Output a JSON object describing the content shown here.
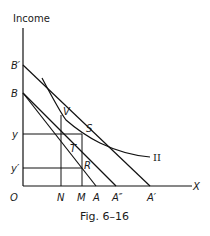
{
  "figure": {
    "y_axis_label": "Income",
    "x_axis_label": "X",
    "origin_label": "O",
    "caption": "Fig. 6–16",
    "curve_label": "II",
    "y_labels": {
      "b_prime": "B′",
      "b": "B",
      "y": "y",
      "y_prime": "y′"
    },
    "x_labels": {
      "n": "N",
      "m": "M",
      "a": "A",
      "a_double": "A″",
      "a_prime": "A′"
    },
    "point_labels": {
      "v": "V",
      "s": "S",
      "t": "T",
      "r": "R"
    }
  }
}
